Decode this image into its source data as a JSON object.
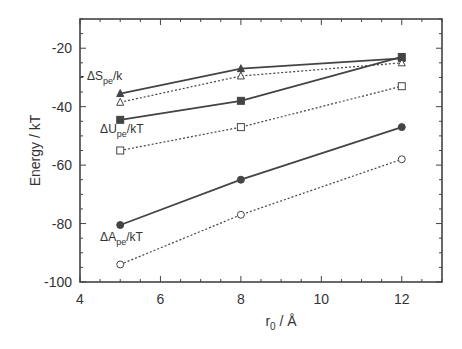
{
  "chart_data": {
    "type": "line",
    "title": "",
    "xlabel": "r0 / Å",
    "ylabel": "Energy / kT",
    "xlim": [
      4,
      13
    ],
    "ylim": [
      -100,
      -10
    ],
    "xticks": [
      4,
      6,
      8,
      10,
      12
    ],
    "yticks": [
      -100,
      -80,
      -60,
      -40,
      -20
    ],
    "grid": false,
    "legend": "inline annotations",
    "x": [
      5,
      8,
      12
    ],
    "series": [
      {
        "name": "-ΔS_pe/k (solid)",
        "marker": "filled-triangle",
        "line": "solid",
        "values": [
          -35.5,
          -27,
          -23.5
        ]
      },
      {
        "name": "-ΔS_pe/k (dotted)",
        "marker": "open-triangle",
        "line": "dotted",
        "values": [
          -38.5,
          -29.5,
          -25
        ]
      },
      {
        "name": "ΔU_pe/kT (solid)",
        "marker": "filled-square",
        "line": "solid",
        "values": [
          -44.5,
          -38,
          -23
        ]
      },
      {
        "name": "ΔU_pe/kT (dotted)",
        "marker": "open-square",
        "line": "dotted",
        "values": [
          -55,
          -47,
          -33
        ]
      },
      {
        "name": "ΔA_pe/kT (solid)",
        "marker": "filled-circle",
        "line": "solid",
        "values": [
          -80.5,
          -65,
          -47
        ]
      },
      {
        "name": "ΔA_pe/kT (dotted)",
        "marker": "open-circle",
        "line": "dotted",
        "values": [
          -94,
          -77,
          -58
        ]
      }
    ],
    "annotations": [
      {
        "text": "- ΔS",
        "sub": "pe",
        "suffix": "/k",
        "x": 5,
        "y": -31
      },
      {
        "text": "ΔU",
        "sub": "pe",
        "suffix": "/kT",
        "x": 4.5,
        "y": -49
      },
      {
        "text": "ΔA",
        "sub": "pe",
        "suffix": "/kT",
        "x": 4.5,
        "y": -86
      }
    ]
  },
  "labels": {
    "ylabel": "Energy / kT",
    "xlabel_main": "r",
    "xlabel_sub": "0",
    "xlabel_tail": " / Å"
  }
}
